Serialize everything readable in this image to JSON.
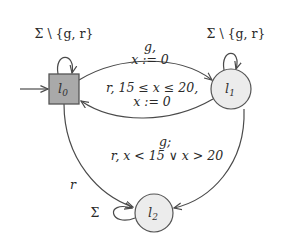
{
  "automaton": {
    "nodes": [
      {
        "id": "l0",
        "label": "l",
        "sub": "0",
        "shape": "square",
        "fill": "#a9a9a9",
        "initial": true
      },
      {
        "id": "l1",
        "label": "l",
        "sub": "1",
        "shape": "circle",
        "fill": "#ececec",
        "initial": false
      },
      {
        "id": "l2",
        "label": "l",
        "sub": "2",
        "shape": "circle",
        "fill": "#ececec",
        "initial": false
      }
    ],
    "edges": {
      "l0_self": {
        "from": "l0",
        "to": "l0",
        "label": "Σ \\ {g, r}"
      },
      "l1_self": {
        "from": "l1",
        "to": "l1",
        "label": "Σ \\ {g, r}"
      },
      "l0_l1": {
        "from": "l0",
        "to": "l1",
        "line1": "g,",
        "line2": "x := 0"
      },
      "l1_l0": {
        "from": "l1",
        "to": "l0",
        "line1": "r, 15 ≤ x ≤ 20,",
        "line2": "x := 0"
      },
      "l1_l2": {
        "from": "l1",
        "to": "l2",
        "line1": "g;",
        "line2": "r, x < 15 ∨ x > 20"
      },
      "l0_l2": {
        "from": "l0",
        "to": "l2",
        "label": "r"
      },
      "l2_self": {
        "from": "l2",
        "to": "l2",
        "label": "Σ"
      }
    },
    "colors": {
      "stroke": "#4a4a4a",
      "initial_fill": "#a9a9a9",
      "state_fill": "#ececec"
    }
  }
}
